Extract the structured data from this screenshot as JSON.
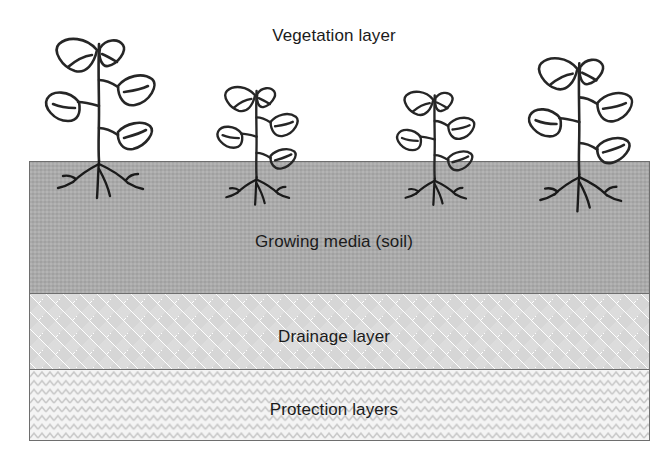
{
  "diagram": {
    "canvas": {
      "width": 668,
      "height": 458
    },
    "colors": {
      "soil_fill": "#acacac",
      "drainage_fill": "#ffffff",
      "drainage_pattern": "#d6d6d6",
      "protection_fill": "#f4f4f4",
      "protection_pattern": "#c9c9c9",
      "outline": "#6e6e6e",
      "ink": "#1b1b1b",
      "background": "#ffffff"
    },
    "labels": {
      "vegetation": "Vegetation layer",
      "growing_media": "Growing media (soil)",
      "drainage": "Drainage layer",
      "protection": "Protection layers"
    },
    "layers": [
      {
        "name": "vegetation",
        "label": "Vegetation layer",
        "fill": "none",
        "pattern": "none"
      },
      {
        "name": "growing-media",
        "label": "Growing media (soil)",
        "fill": "#acacac",
        "pattern": "solid-gray"
      },
      {
        "name": "drainage",
        "label": "Drainage layer",
        "fill": "#ffffff",
        "pattern": "diamond-checker"
      },
      {
        "name": "protection",
        "label": "Protection layers",
        "fill": "#f4f4f4",
        "pattern": "zigzag-chevron"
      }
    ],
    "plants": [
      {
        "id": "plant-1",
        "x": 42,
        "y": 28,
        "scale": 1.0,
        "leaf_pairs": 3
      },
      {
        "id": "plant-2",
        "x": 214,
        "y": 79,
        "scale": 0.74,
        "leaf_pairs": 3
      },
      {
        "id": "plant-3",
        "x": 394,
        "y": 84,
        "scale": 0.71,
        "leaf_pairs": 3
      },
      {
        "id": "plant-4",
        "x": 525,
        "y": 48,
        "scale": 0.95,
        "leaf_pairs": 3
      }
    ]
  }
}
